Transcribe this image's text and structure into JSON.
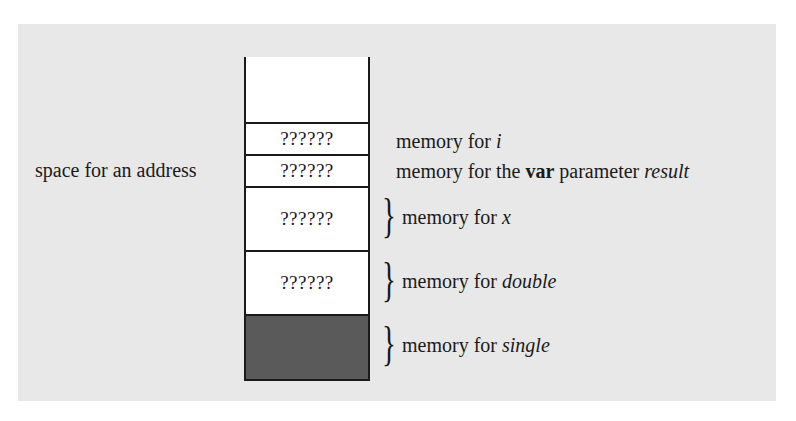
{
  "diagram": {
    "left_label": "space for an address",
    "cells": [
      {
        "id": "top-empty",
        "text": "",
        "fill": "#ffffff"
      },
      {
        "id": "i",
        "text": "??????",
        "fill": "#ffffff"
      },
      {
        "id": "result",
        "text": "??????",
        "fill": "#ffffff"
      },
      {
        "id": "x",
        "text": "??????",
        "fill": "#ffffff"
      },
      {
        "id": "double",
        "text": "??????",
        "fill": "#ffffff"
      },
      {
        "id": "single",
        "text": "",
        "fill": "#5a5a5a"
      }
    ],
    "labels": {
      "i": {
        "prefix": "memory for ",
        "var": "i"
      },
      "result": {
        "prefix": "memory for the ",
        "keyword": "var",
        "middle": " parameter ",
        "var": "result"
      },
      "x": {
        "prefix": "memory for ",
        "var": "x"
      },
      "double": {
        "prefix": "memory for ",
        "var": "double"
      },
      "single": {
        "prefix": "memory for ",
        "var": "single"
      }
    },
    "colors": {
      "panel": "#e8e8e8",
      "cell": "#ffffff",
      "shaded_cell": "#5a5a5a",
      "stroke": "#1a1a1a"
    }
  }
}
